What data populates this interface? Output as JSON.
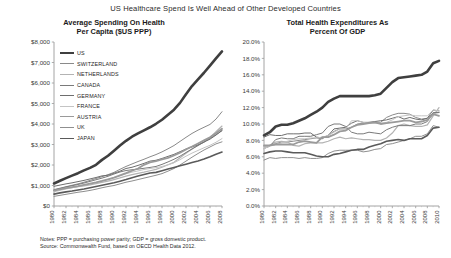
{
  "title": "US Healthcare Spend Is Well Ahead of Other Developed Countries",
  "footnotes": {
    "notes": "Notes: PPP = purchasing power parity; GDP = gross domestic product.",
    "source": "Source: Commonwealth Fund, based on OECD Health Data 2012."
  },
  "legend": {
    "items": [
      {
        "label": "US",
        "color": "#3f3f3f",
        "width": 2.6
      },
      {
        "label": "SWITZERLAND",
        "color": "#8a8a8a",
        "width": 1.0
      },
      {
        "label": "NETHERLANDS",
        "color": "#b3b3b3",
        "width": 1.2
      },
      {
        "label": "CANADA",
        "color": "#7a7a7a",
        "width": 1.0
      },
      {
        "label": "GERMANY",
        "color": "#6e6e6e",
        "width": 1.0
      },
      {
        "label": "FRANCE",
        "color": "#c4c4c4",
        "width": 1.0
      },
      {
        "label": "AUSTRIA",
        "color": "#9a9a9a",
        "width": 1.8
      },
      {
        "label": "UK",
        "color": "#8f8f8f",
        "width": 1.0
      },
      {
        "label": "JAPAN",
        "color": "#5a5a5a",
        "width": 1.6
      }
    ]
  },
  "chart_data": [
    {
      "type": "line",
      "title": "Average Spending On Health Per Capita ($US PPP)",
      "title_line1": "Average Spending On Health",
      "title_line2": "Per Capita ($US PPP)",
      "xlabel": "",
      "ylabel": "",
      "ylim": [
        0,
        8000
      ],
      "yticks": [
        0,
        1000,
        2000,
        3000,
        4000,
        5000,
        6000,
        7000,
        8000
      ],
      "ytick_labels": [
        "$0",
        "$1,000",
        "$2,000",
        "$3,000",
        "$4,000",
        "$5,000",
        "$6,000",
        "$7,000",
        "$8,000"
      ],
      "xlim": [
        1980,
        2008
      ],
      "x": [
        1980,
        1981,
        1982,
        1983,
        1984,
        1985,
        1986,
        1987,
        1988,
        1989,
        1990,
        1991,
        1992,
        1993,
        1994,
        1995,
        1996,
        1997,
        1998,
        1999,
        2000,
        2001,
        2002,
        2003,
        2004,
        2005,
        2006,
        2007,
        2008
      ],
      "xticks": [
        1980,
        1982,
        1984,
        1986,
        1988,
        1990,
        1992,
        1994,
        1996,
        1998,
        2000,
        2002,
        2004,
        2006,
        2008
      ],
      "xtick_labels": [
        "1980",
        "1982",
        "1984",
        "1986",
        "1988",
        "1990",
        "1992",
        "1994",
        "1996",
        "1998",
        "2000",
        "2002",
        "2004",
        "2006",
        "2008"
      ],
      "grid": false,
      "legend_position": "upper-left-inside",
      "series": [
        {
          "name": "US",
          "values": [
            1100,
            1230,
            1360,
            1480,
            1600,
            1740,
            1860,
            2010,
            2250,
            2450,
            2700,
            2950,
            3180,
            3380,
            3540,
            3690,
            3840,
            4010,
            4210,
            4450,
            4700,
            5030,
            5450,
            5850,
            6180,
            6500,
            6850,
            7200,
            7540
          ]
        },
        {
          "name": "SWITZERLAND",
          "values": [
            800,
            870,
            940,
            1010,
            1080,
            1160,
            1250,
            1340,
            1430,
            1530,
            1640,
            1790,
            1930,
            2050,
            2170,
            2280,
            2400,
            2510,
            2640,
            2790,
            2950,
            3150,
            3350,
            3540,
            3700,
            3840,
            3980,
            4240,
            4600
          ]
        },
        {
          "name": "NETHERLANDS",
          "values": [
            760,
            810,
            860,
            900,
            940,
            980,
            1030,
            1090,
            1150,
            1210,
            1290,
            1370,
            1460,
            1530,
            1590,
            1650,
            1720,
            1790,
            1890,
            2010,
            2130,
            2350,
            2570,
            2780,
            2960,
            3120,
            3340,
            3620,
            3900
          ]
        },
        {
          "name": "CANADA",
          "values": [
            780,
            850,
            930,
            990,
            1050,
            1120,
            1200,
            1280,
            1360,
            1450,
            1560,
            1660,
            1730,
            1770,
            1800,
            1840,
            1880,
            1930,
            2030,
            2150,
            2280,
            2430,
            2610,
            2780,
            2950,
            3120,
            3300,
            3480,
            3670
          ]
        },
        {
          "name": "GERMANY",
          "values": [
            960,
            1020,
            1080,
            1130,
            1190,
            1250,
            1320,
            1390,
            1470,
            1500,
            1600,
            1700,
            1830,
            1890,
            1980,
            2080,
            2190,
            2230,
            2320,
            2420,
            2520,
            2650,
            2780,
            2880,
            2980,
            3120,
            3260,
            3460,
            3690
          ]
        },
        {
          "name": "FRANCE",
          "values": [
            690,
            760,
            830,
            890,
            950,
            1010,
            1080,
            1140,
            1210,
            1290,
            1390,
            1470,
            1570,
            1650,
            1710,
            1780,
            1830,
            1870,
            1930,
            2010,
            2110,
            2260,
            2430,
            2580,
            2710,
            2840,
            2960,
            3110,
            3290
          ]
        },
        {
          "name": "AUSTRIA",
          "values": [
            750,
            810,
            870,
            920,
            970,
            1030,
            1090,
            1150,
            1220,
            1300,
            1380,
            1490,
            1600,
            1720,
            1830,
            2010,
            2130,
            2190,
            2270,
            2350,
            2470,
            2600,
            2760,
            2900,
            3050,
            3200,
            3350,
            3550,
            3770
          ]
        },
        {
          "name": "UK",
          "values": [
            470,
            520,
            570,
            620,
            670,
            710,
            760,
            820,
            890,
            950,
            1000,
            1080,
            1160,
            1220,
            1290,
            1360,
            1430,
            1500,
            1580,
            1700,
            1830,
            2000,
            2190,
            2380,
            2560,
            2730,
            2880,
            3030,
            3130
          ]
        },
        {
          "name": "JAPAN",
          "values": [
            580,
            640,
            690,
            730,
            780,
            830,
            890,
            950,
            1010,
            1070,
            1130,
            1210,
            1290,
            1380,
            1460,
            1540,
            1610,
            1640,
            1720,
            1800,
            1880,
            1960,
            2040,
            2120,
            2200,
            2290,
            2400,
            2520,
            2630
          ]
        }
      ]
    },
    {
      "type": "line",
      "title": "Total Health Expenditures As Percent Of GDP",
      "title_line1": "Total Health Expenditures As",
      "title_line2": "Percent Of GDP",
      "xlabel": "",
      "ylabel": "",
      "ylim": [
        0,
        20
      ],
      "yticks": [
        0,
        2,
        4,
        6,
        8,
        10,
        12,
        14,
        16,
        18,
        20
      ],
      "ytick_labels": [
        "0.0%",
        "2.0%",
        "4.0%",
        "6.0%",
        "8.0%",
        "10.0%",
        "12.0%",
        "14.0%",
        "16.0%",
        "18.0%",
        "20.0%"
      ],
      "xlim": [
        1980,
        2010
      ],
      "x": [
        1980,
        1981,
        1982,
        1983,
        1984,
        1985,
        1986,
        1987,
        1988,
        1989,
        1990,
        1991,
        1992,
        1993,
        1994,
        1995,
        1996,
        1997,
        1998,
        1999,
        2000,
        2001,
        2002,
        2003,
        2004,
        2005,
        2006,
        2007,
        2008,
        2009,
        2010
      ],
      "xticks": [
        1980,
        1982,
        1984,
        1986,
        1988,
        1990,
        1992,
        1994,
        1996,
        1998,
        2000,
        2002,
        2004,
        2006,
        2008,
        2010
      ],
      "xtick_labels": [
        "1980",
        "1982",
        "1984",
        "1986",
        "1988",
        "1990",
        "1992",
        "1994",
        "1996",
        "1998",
        "2000",
        "2002",
        "2004",
        "2006",
        "2008",
        "2010"
      ],
      "grid": false,
      "legend_position": "none",
      "series": [
        {
          "name": "US",
          "values": [
            8.6,
            9.0,
            9.7,
            9.9,
            9.9,
            10.1,
            10.4,
            10.7,
            11.1,
            11.5,
            12.0,
            12.7,
            13.1,
            13.4,
            13.4,
            13.4,
            13.4,
            13.4,
            13.4,
            13.5,
            13.7,
            14.4,
            15.1,
            15.6,
            15.7,
            15.8,
            15.9,
            16.0,
            16.4,
            17.4,
            17.7
          ]
        },
        {
          "name": "SWITZERLAND",
          "values": [
            7.3,
            7.4,
            7.6,
            7.8,
            7.8,
            7.9,
            8.0,
            8.1,
            8.2,
            8.3,
            8.2,
            8.6,
            9.1,
            9.4,
            9.4,
            9.6,
            10.0,
            10.1,
            10.2,
            10.2,
            10.2,
            10.8,
            11.1,
            11.3,
            11.3,
            11.2,
            10.8,
            10.6,
            10.7,
            11.3,
            11.4
          ]
        },
        {
          "name": "NETHERLANDS",
          "values": [
            7.2,
            7.4,
            7.8,
            7.9,
            7.8,
            7.4,
            7.3,
            7.6,
            7.7,
            7.7,
            7.7,
            7.9,
            8.2,
            8.4,
            8.2,
            8.3,
            8.2,
            8.1,
            8.1,
            8.0,
            8.0,
            8.3,
            8.9,
            9.8,
            10.0,
            9.8,
            9.7,
            9.7,
            9.9,
            11.0,
            12.0
          ]
        },
        {
          "name": "CANADA",
          "values": [
            7.0,
            7.3,
            8.1,
            8.3,
            8.2,
            8.2,
            8.5,
            8.5,
            8.5,
            8.7,
            8.9,
            9.7,
            10.0,
            10.0,
            9.7,
            9.0,
            8.8,
            8.8,
            9.0,
            8.9,
            8.8,
            9.3,
            9.6,
            9.8,
            9.8,
            9.8,
            10.0,
            10.0,
            10.3,
            11.4,
            11.4
          ]
        },
        {
          "name": "GERMANY",
          "values": [
            8.4,
            8.7,
            8.6,
            8.6,
            8.8,
            8.8,
            8.8,
            8.9,
            8.9,
            8.4,
            8.3,
            8.6,
            9.4,
            9.5,
            9.6,
            10.1,
            10.4,
            10.2,
            10.2,
            10.3,
            10.4,
            10.5,
            10.7,
            10.9,
            10.6,
            10.8,
            10.6,
            10.5,
            10.7,
            11.7,
            11.6
          ]
        },
        {
          "name": "FRANCE",
          "values": [
            7.0,
            7.3,
            7.5,
            7.7,
            7.9,
            8.1,
            8.2,
            8.2,
            8.3,
            8.3,
            8.4,
            8.6,
            9.0,
            9.4,
            9.4,
            10.4,
            10.4,
            10.2,
            10.1,
            10.1,
            10.1,
            10.2,
            10.5,
            10.9,
            11.0,
            11.1,
            11.0,
            11.0,
            11.0,
            11.7,
            11.6
          ]
        },
        {
          "name": "AUSTRIA",
          "values": [
            7.4,
            7.4,
            7.5,
            7.5,
            7.5,
            7.5,
            7.8,
            7.9,
            7.8,
            7.7,
            8.4,
            8.4,
            8.7,
            9.1,
            9.2,
            9.6,
            9.9,
            10.0,
            10.1,
            10.2,
            10.0,
            10.1,
            10.2,
            10.3,
            10.4,
            10.4,
            10.2,
            10.3,
            10.5,
            11.2,
            11.0
          ]
        },
        {
          "name": "UK",
          "values": [
            5.6,
            5.9,
            5.8,
            5.9,
            5.9,
            5.9,
            5.8,
            5.9,
            5.8,
            5.8,
            5.9,
            6.4,
            6.7,
            6.8,
            6.8,
            6.8,
            6.8,
            6.6,
            6.7,
            6.9,
            7.0,
            7.5,
            7.6,
            7.8,
            8.0,
            8.2,
            8.5,
            8.5,
            8.8,
            9.8,
            9.6
          ]
        },
        {
          "name": "JAPAN",
          "values": [
            6.4,
            6.6,
            6.7,
            6.7,
            6.6,
            6.5,
            6.5,
            6.5,
            6.3,
            6.1,
            6.0,
            6.0,
            6.3,
            6.4,
            6.6,
            6.8,
            6.9,
            6.9,
            7.2,
            7.4,
            7.6,
            7.9,
            8.0,
            8.1,
            8.0,
            8.2,
            8.2,
            8.2,
            8.6,
            9.5,
            9.6
          ]
        }
      ]
    }
  ]
}
